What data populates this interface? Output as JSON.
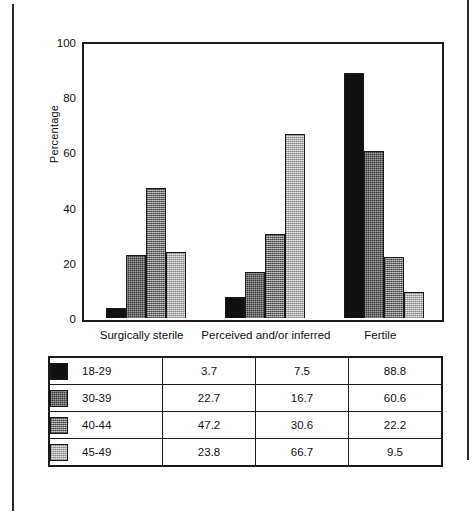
{
  "chart_data": {
    "type": "bar",
    "title": "",
    "xlabel": "",
    "ylabel": "Percentage",
    "ylim": [
      0,
      100
    ],
    "yticks": [
      "0",
      "20",
      "40",
      "60",
      "80",
      "100"
    ],
    "grid": false,
    "legend_position": "bottom-table",
    "categories": [
      "Surgically sterile",
      "Perceived and/or inferred",
      "Fertile"
    ],
    "series": [
      {
        "name": "18-29",
        "values": [
          3.7,
          7.5,
          88.8
        ],
        "swatch": "solid-black",
        "fill_class": "fill-0"
      },
      {
        "name": "30-39",
        "values": [
          22.7,
          16.7,
          60.6
        ],
        "swatch": "dark-dither",
        "fill_class": "fill-1"
      },
      {
        "name": "40-44",
        "values": [
          47.2,
          30.6,
          22.2
        ],
        "swatch": "medium-dither",
        "fill_class": "fill-2"
      },
      {
        "name": "45-49",
        "values": [
          23.8,
          66.7,
          9.5
        ],
        "swatch": "light-dither",
        "fill_class": "fill-3"
      }
    ]
  },
  "table": {
    "rows": [
      {
        "series": "18-29",
        "values": [
          "3.7",
          "7.5",
          "88.8"
        ]
      },
      {
        "series": "30-39",
        "values": [
          "22.7",
          "16.7",
          "60.6"
        ]
      },
      {
        "series": "40-44",
        "values": [
          "47.2",
          "30.6",
          "22.2"
        ]
      },
      {
        "series": "45-49",
        "values": [
          "23.8",
          "66.7",
          "9.5"
        ]
      }
    ]
  },
  "colors": {
    "ink": "#111111",
    "frame": "#1a1a1a",
    "series_0": "#111111",
    "series_1": "#3a3a3a",
    "series_2": "#8d8d8d",
    "series_3": "#cfcfcf"
  }
}
